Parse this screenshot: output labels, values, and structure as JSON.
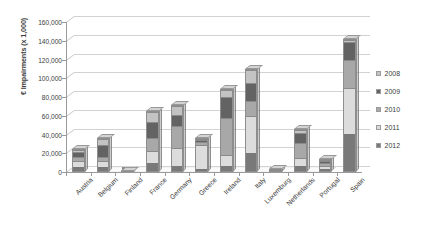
{
  "chart_data": {
    "type": "bar",
    "subtype": "stacked-column-3d",
    "title": "",
    "xlabel": "",
    "ylabel": "€ Impairments (x 1,000)",
    "ylim": [
      0,
      160000
    ],
    "ytick_step": 20000,
    "ytick_labels": [
      "160,000",
      "140,000",
      "120,000",
      "100,000",
      "80,000",
      "60,000",
      "40,000",
      "20,000",
      "0"
    ],
    "ytick_values": [
      160000,
      140000,
      120000,
      100000,
      80000,
      60000,
      40000,
      20000,
      0
    ],
    "grid": true,
    "legend_position": "right",
    "categories": [
      "Austria",
      "Belgium",
      "Finland",
      "France",
      "Germany",
      "Greece",
      "Ireland",
      "Italy",
      "Luxemburg",
      "Netherlands",
      "Portugal",
      "Spain"
    ],
    "series": [
      {
        "name": "2008",
        "color": "#c3c3c3",
        "values": [
          3000,
          6000,
          200,
          11000,
          9000,
          1000,
          8000,
          14000,
          300,
          4000,
          1500,
          2000
        ]
      },
      {
        "name": "2009",
        "color": "#636363",
        "values": [
          5000,
          14000,
          200,
          18000,
          12000,
          2000,
          23000,
          20000,
          500,
          11000,
          2500,
          20000
        ]
      },
      {
        "name": "2010",
        "color": "#a8a8a8",
        "values": [
          5000,
          5000,
          200,
          14000,
          25000,
          3000,
          40000,
          16000,
          700,
          16000,
          3000,
          30000
        ]
      },
      {
        "name": "2011",
        "color": "#dcdcdc",
        "values": [
          7000,
          6000,
          200,
          13000,
          20000,
          28000,
          12000,
          40000,
          800,
          9000,
          4000,
          50000
        ]
      },
      {
        "name": "2012",
        "color": "#797979",
        "values": [
          5000,
          5000,
          200,
          9000,
          5000,
          2000,
          6000,
          20000,
          700,
          6000,
          3000,
          40000
        ]
      }
    ],
    "totals": [
      25000,
      36000,
      1000,
      65000,
      71000,
      36000,
      89000,
      110000,
      3000,
      46000,
      14000,
      142000
    ]
  },
  "legend": {
    "items": [
      {
        "label": "2008",
        "color": "#c3c3c3"
      },
      {
        "label": "2009",
        "color": "#636363"
      },
      {
        "label": "2010",
        "color": "#a8a8a8"
      },
      {
        "label": "2011",
        "color": "#dcdcdc"
      },
      {
        "label": "2012",
        "color": "#797979"
      }
    ]
  }
}
